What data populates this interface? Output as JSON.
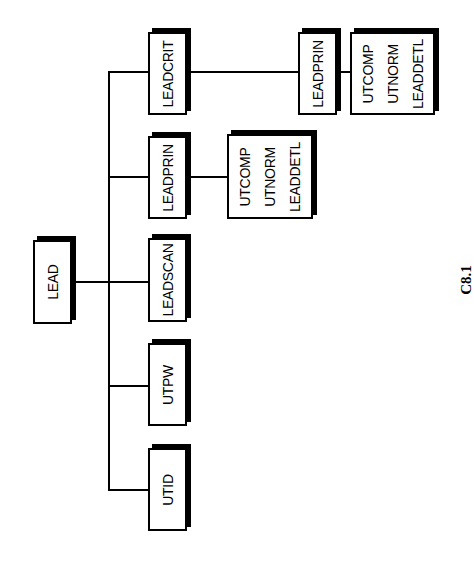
{
  "diagram": {
    "type": "tree",
    "orientation": "rotated -90deg (root at left, children stacked vertically)",
    "figure_label": "C8.1",
    "root": {
      "label": "LEAD",
      "children": [
        {
          "label": "LEADCRIT",
          "children": [
            {
              "label": "LEADPRIN",
              "children": [
                {
                  "items": [
                    "UTCOMP",
                    "UTNORM",
                    "LEADDETL"
                  ]
                }
              ]
            }
          ]
        },
        {
          "label": "LEADPRIN",
          "children": [
            {
              "items": [
                "UTCOMP",
                "UTNORM",
                "LEADDETL"
              ]
            }
          ]
        },
        {
          "label": "LEADSCAN"
        },
        {
          "label": "UTPW"
        },
        {
          "label": "UTID"
        }
      ]
    }
  },
  "nodes": {
    "lead": "LEAD",
    "leadcrit": "LEADCRIT",
    "leadprin": "LEADPRIN",
    "leadscan": "LEADSCAN",
    "utpw": "UTPW",
    "utid": "UTID",
    "leadcrit_leadprin": "LEADPRIN",
    "leadprin_leaf": {
      "item1": "UTCOMP",
      "item2": "UTNORM",
      "item3": "LEADDETL"
    },
    "leadcrit_leaf": {
      "item1": "UTCOMP",
      "item2": "UTNORM",
      "item3": "LEADDETL"
    }
  },
  "colors": {
    "line": "#000000",
    "box_fill": "#ffffff",
    "background": "#ffffff"
  }
}
